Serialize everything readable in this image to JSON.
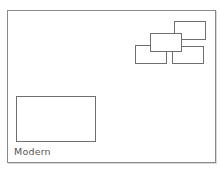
{
  "template": {
    "name": "Modern",
    "selected": false
  },
  "zones": [
    {
      "id": "small-bottom-left",
      "left": 135,
      "top": 45,
      "width": 32,
      "height": 19
    },
    {
      "id": "small-bottom-right",
      "left": 172,
      "top": 46,
      "width": 32,
      "height": 18
    },
    {
      "id": "small-top-right",
      "left": 174,
      "top": 21,
      "width": 32,
      "height": 19
    },
    {
      "id": "small-middle",
      "left": 150,
      "top": 33,
      "width": 32,
      "height": 19
    },
    {
      "id": "large-bottom-left",
      "left": 16,
      "top": 96,
      "width": 80,
      "height": 46
    }
  ],
  "colors": {
    "frame_border": "#8a8a8a",
    "zone_border": "#6e6e6e",
    "label_text": "#555555",
    "background": "#ffffff"
  }
}
